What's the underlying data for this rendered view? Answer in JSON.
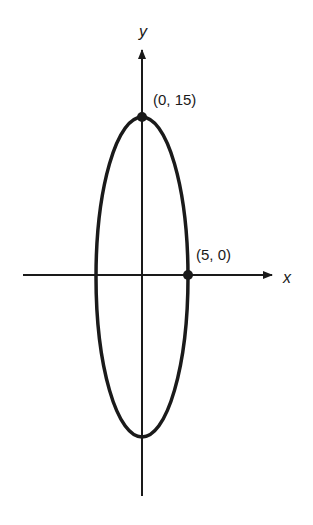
{
  "diagram": {
    "type": "ellipse-on-axes",
    "axes": {
      "x_label": "x",
      "y_label": "y"
    },
    "points": [
      {
        "label": "(0, 15)",
        "x": 0,
        "y": 15
      },
      {
        "label": "(5, 0)",
        "x": 5,
        "y": 0
      }
    ],
    "ellipse": {
      "semi_major": 15,
      "semi_minor": 5,
      "center": [
        0,
        0
      ]
    },
    "colors": {
      "stroke": "#1a1a1a",
      "background": "#ffffff"
    }
  }
}
